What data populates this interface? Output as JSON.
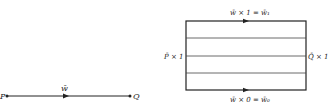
{
  "left_diagram": {
    "start_label": "P",
    "end_label": "Q",
    "path_label": "w̄"
  },
  "right_diagram": {
    "top_label": "w̄ × 1 = w̄₁",
    "bottom_label": "w̄ × 0 = w̄₀",
    "left_label": "P̄ × 1",
    "right_label": "Q̄ × 1",
    "inner_line_count": 3
  },
  "colors": {
    "stroke": "#222222",
    "background": "#ffffff"
  }
}
